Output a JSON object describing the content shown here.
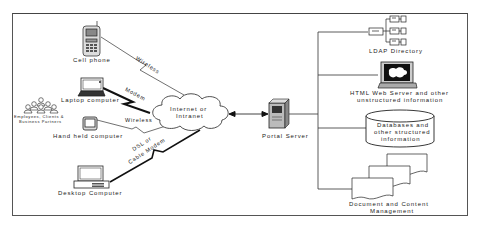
{
  "diagram": {
    "type": "network-architecture",
    "clients": [
      {
        "id": "cell-phone",
        "label": "Cell phone",
        "icon": "cell-phone-icon",
        "connection": "Wireless"
      },
      {
        "id": "laptop",
        "label": "Laptop computer",
        "icon": "laptop-icon",
        "connection": "Modem"
      },
      {
        "id": "handheld",
        "label": "Hand held computer",
        "icon": "handheld-icon",
        "connection": "Wireless"
      },
      {
        "id": "desktop",
        "label": "Desktop Computer",
        "icon": "desktop-icon",
        "connection": "DSL or Cable Modem"
      }
    ],
    "users": {
      "label_line1": "Employees, Clients &",
      "label_line2": "Business Partners",
      "icon": "people-group-icon"
    },
    "network": {
      "label_line1": "Internet or",
      "label_line2": "Intranet",
      "icon": "cloud-icon"
    },
    "server": {
      "label": "Portal Server",
      "icon": "server-tower-icon"
    },
    "backends": [
      {
        "id": "ldap",
        "label_line1": "LDAP Directory",
        "label_line2": "",
        "icon": "directory-tree-icon"
      },
      {
        "id": "html",
        "label_line1": "HTML Web Server and other",
        "label_line2": "unstructured information",
        "icon": "monitor-icon"
      },
      {
        "id": "db",
        "label_line1": "Databases and",
        "label_line2": "other structured",
        "label_line3": "information",
        "icon": "database-cylinder-icon"
      },
      {
        "id": "docs",
        "label_line1": "Document and Content",
        "label_line2": "Management",
        "icon": "documents-stack-icon"
      }
    ],
    "edges": [
      {
        "from": "cell-phone",
        "to": "network",
        "label": "Wireless",
        "style": "thin-lightning"
      },
      {
        "from": "laptop",
        "to": "network",
        "label": "Modem",
        "style": "thick-lightning"
      },
      {
        "from": "handheld",
        "to": "network",
        "label": "Wireless",
        "style": "thin-lightning"
      },
      {
        "from": "desktop",
        "to": "network",
        "label": "DSL or Cable Modem",
        "style": "thick-lightning"
      },
      {
        "from": "network",
        "to": "server",
        "label": "",
        "style": "bidirectional-arrow"
      },
      {
        "from": "server",
        "to": "ldap",
        "label": "",
        "style": "bus"
      },
      {
        "from": "server",
        "to": "html",
        "label": "",
        "style": "bus"
      },
      {
        "from": "server",
        "to": "db",
        "label": "",
        "style": "bus"
      },
      {
        "from": "server",
        "to": "docs",
        "label": "",
        "style": "bus"
      }
    ],
    "connection_labels": {
      "wireless_top": "Wireless",
      "modem": "Modem",
      "wireless_mid": "Wireless",
      "dsl_line1": "DSL or",
      "dsl_line2": "Cable Modem"
    }
  }
}
